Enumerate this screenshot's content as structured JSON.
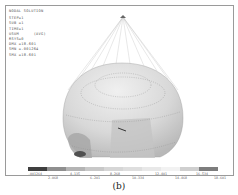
{
  "plot": {
    "info": {
      "title": "NODAL SOLUTION",
      "lines": [
        "STEP=1",
        "SUB =1",
        "TIME=1",
        "USUM      (AVG)",
        "RSYS=0",
        "DMX =18.601",
        "SMN =.001264",
        "SMX =18.601"
      ]
    },
    "legend": {
      "colors": [
        "#3f3f3f",
        "#8f8f8f",
        "#b4b4b4",
        "#c8c8c8",
        "#d6d6d6",
        "#dedede",
        "#e8e8e8",
        "#f2f2f2",
        "#cfcfcf",
        "#7d7d7d"
      ],
      "labels_top": [
        ".001264",
        "4.135",
        "8.268",
        "12.401",
        "16.534"
      ],
      "labels_bottom": [
        "2.068",
        "6.201",
        "10.334",
        "14.468",
        "18.601"
      ]
    }
  },
  "caption": "(b)"
}
